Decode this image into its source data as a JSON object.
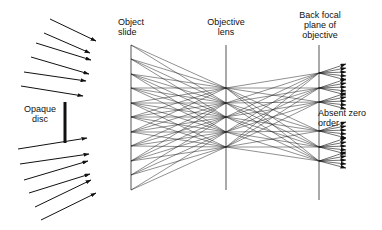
{
  "labels": {
    "opaque_disc": "Opaque\ndisc",
    "object_slide": "Object\nslide",
    "objective_lens": "Objective\nlens",
    "back_focal_plane": "Back focal\nplane of\nobjective",
    "absent_zero_order": "Absent zero\norder"
  },
  "colors": {
    "line": "#111111",
    "thin": "#333333",
    "plane": "#555555"
  },
  "geometry": {
    "slide_x": 131,
    "slide_y": [
      45,
      190
    ],
    "lens_x": 226,
    "lens_y": [
      45,
      190
    ],
    "focal_x": 319,
    "focal_y": [
      45,
      200
    ],
    "disc": {
      "x": 65,
      "y1": 102,
      "y2": 143
    },
    "incoming_arrows": [
      [
        50,
        19,
        96,
        41
      ],
      [
        44,
        33,
        90,
        53
      ],
      [
        36,
        43,
        91,
        60
      ],
      [
        31,
        57,
        89,
        74
      ],
      [
        24,
        72,
        86,
        81
      ],
      [
        21,
        86,
        83,
        96
      ],
      [
        18,
        149,
        87,
        138
      ],
      [
        20,
        164,
        89,
        154
      ],
      [
        24,
        180,
        88,
        161
      ],
      [
        29,
        193,
        90,
        174
      ],
      [
        35,
        207,
        91,
        180
      ],
      [
        41,
        220,
        96,
        193
      ]
    ],
    "slide_points": [
      45,
      59,
      74,
      88,
      103,
      117,
      132,
      146,
      161,
      175,
      190
    ],
    "lens_points": [
      88,
      103,
      117,
      132,
      147
    ],
    "focal_points": [
      73,
      88,
      102,
      131,
      147,
      161
    ],
    "absent_zero_order_y": 117
  }
}
